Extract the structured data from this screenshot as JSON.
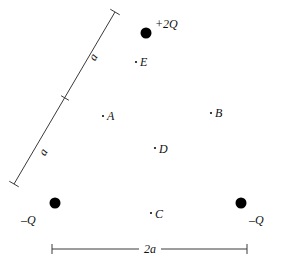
{
  "figure": {
    "background_color": "#ffffff",
    "ink_color": "#000000",
    "width": 282,
    "height": 269
  },
  "charges": [
    {
      "id": "charge-top",
      "label": "+2Q",
      "sign": "positive",
      "magnitude": "2Q",
      "cx": 146,
      "cy": 33,
      "r": 5.5,
      "label_x": 155,
      "label_y": 18
    },
    {
      "id": "charge-bottom-left",
      "label": "–Q",
      "sign": "negative",
      "magnitude": "Q",
      "cx": 55,
      "cy": 203,
      "r": 5.5,
      "label_x": 21,
      "label_y": 214
    },
    {
      "id": "charge-bottom-right",
      "label": "–Q",
      "sign": "negative",
      "magnitude": "Q",
      "cx": 241,
      "cy": 203,
      "r": 5.5,
      "label_x": 249,
      "label_y": 214
    }
  ],
  "points": [
    {
      "id": "point-a",
      "label": "A",
      "dot_x": 103,
      "dot_y": 116,
      "label_x": 107,
      "label_y": 110
    },
    {
      "id": "point-b",
      "label": "B",
      "dot_x": 211,
      "dot_y": 113,
      "label_x": 215,
      "label_y": 107
    },
    {
      "id": "point-c",
      "label": "C",
      "dot_x": 151,
      "dot_y": 213,
      "label_x": 155,
      "label_y": 208
    },
    {
      "id": "point-d",
      "label": "D",
      "dot_x": 155,
      "dot_y": 148,
      "label_x": 159,
      "label_y": 143
    },
    {
      "id": "point-e",
      "label": "E",
      "dot_x": 136,
      "dot_y": 62,
      "label_x": 140,
      "label_y": 56
    }
  ],
  "dimensions": [
    {
      "id": "dimension-left-side",
      "label_upper": "a",
      "label_lower": "a",
      "value": "a",
      "note": "left side of triangle, split by a center tick into two segments each labeled a",
      "x1": 14,
      "y1": 184,
      "x2": 115,
      "y2": 12,
      "tick_x": 65,
      "tick_y": 98,
      "label_upper_x": 90,
      "label_upper_y": 51,
      "label_lower_x": 40,
      "label_lower_y": 146,
      "rotation_deg": -60
    },
    {
      "id": "dimension-base",
      "label": "2a",
      "value": "2a",
      "note": "horizontal baseline dimension between the two –Q charges",
      "x1": 52,
      "y1": 249,
      "x2": 247,
      "y2": 249,
      "label_x": 150,
      "label_y": 249
    }
  ]
}
